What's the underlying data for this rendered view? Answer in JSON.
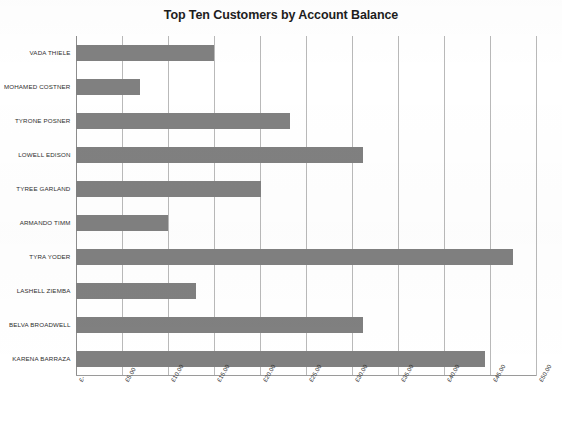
{
  "chart_data": {
    "type": "bar",
    "orientation": "horizontal",
    "title": "Top Ten Customers by Account Balance",
    "xlabel": "",
    "ylabel": "",
    "categories": [
      "VADA THIELE",
      "MOHAMED COSTNER",
      "TYRONE POSNER",
      "LOWELL EDISON",
      "TYREE GARLAND",
      "ARMANDO TIMM",
      "TYRA YODER",
      "LASHELL ZIEMBA",
      "BELVA BROADWELL",
      "KARENA BARRAZA"
    ],
    "values": [
      15.1,
      7.0,
      23.3,
      31.2,
      20.2,
      10.1,
      47.5,
      13.1,
      31.2,
      44.5
    ],
    "xlim": [
      0,
      50
    ],
    "xticks": [
      0,
      5,
      10,
      15,
      20,
      25,
      30,
      35,
      40,
      45,
      50
    ],
    "xtick_labels": [
      "£-",
      "£5.00",
      "£10.00",
      "£15.00",
      "£20.00",
      "£25.00",
      "£30.00",
      "£35.00",
      "£40.00",
      "£45.00",
      "£50.00"
    ],
    "grid": true,
    "grid_axis": "x",
    "legend": false,
    "bar_color": "#808080",
    "gridline_color": "#b9b9b9",
    "background_color": "#ffffff"
  }
}
